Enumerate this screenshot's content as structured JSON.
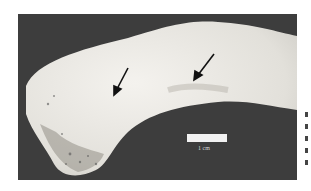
{
  "figure": {
    "scale_bar": {
      "label": "1 cm"
    },
    "arrows": [
      {
        "name": "arrow-left",
        "from": [
          110,
          54
        ],
        "to": [
          96,
          80
        ]
      },
      {
        "name": "arrow-right",
        "from": [
          196,
          40
        ],
        "to": [
          176,
          66
        ]
      }
    ],
    "colors": {
      "background": "#3d3d3d",
      "bone": "#e8e6e0",
      "page": "#ffffff"
    }
  }
}
